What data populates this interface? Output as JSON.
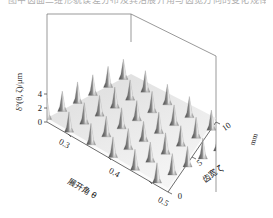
{
  "figure": {
    "kind": "surface-3d",
    "background": "#ffffff",
    "cut_off_caption": "图中齿面三维形貌误差分布及其沿展开角与齿宽方向的变化规律"
  },
  "chart_data": {
    "type": "heatmap",
    "title": "",
    "subtitle": "",
    "render_style": "3d-surface-mesh",
    "colormap": "grayscale",
    "colormap_low": "#4f4f4f",
    "colormap_high": "#f2f2f2",
    "grid": false,
    "legend": "none",
    "zlabel": "δ°(θ, ζ)/μm",
    "zticks": [
      "0",
      "2",
      "4"
    ],
    "ztick_values": [
      0,
      2,
      4
    ],
    "zlim": [
      0,
      5
    ],
    "xlabel": "展开角 θ",
    "xticks": [
      "0.3",
      "0.4",
      "0.5"
    ],
    "xtick_values": [
      0.3,
      0.4,
      0.5
    ],
    "xlim": [
      0.25,
      0.52
    ],
    "ylabel": "齿宽 ζ",
    "yunit": "mm",
    "yticks": [
      "0",
      "5",
      "10"
    ],
    "ytick_values": [
      0,
      5,
      10
    ],
    "ylim": [
      0,
      12
    ],
    "surface_description": "periodic array of sharp conical peaks, amplitude 0 to 5 um",
    "peak_amplitude_um": 5,
    "peak_count_x": 12,
    "peak_count_y": 12,
    "x": [
      0.25,
      0.2727,
      0.2955,
      0.3182,
      0.3409,
      0.3636,
      0.3864,
      0.4091,
      0.4318,
      0.4545,
      0.4773,
      0.5
    ],
    "y": [
      0,
      1.0909,
      2.1818,
      3.2727,
      4.3636,
      5.4545,
      6.5455,
      7.6364,
      8.7273,
      9.8182,
      10.9091,
      12
    ],
    "z_rows": [
      [
        4.8,
        0.4,
        4.6,
        0.5,
        4.9,
        0.3,
        4.7,
        0.4,
        4.8,
        0.5,
        4.6,
        0.4
      ],
      [
        0.5,
        0.2,
        0.6,
        0.2,
        0.5,
        0.2,
        0.6,
        0.2,
        0.5,
        0.2,
        0.6,
        0.2
      ],
      [
        4.6,
        0.5,
        4.9,
        0.4,
        4.7,
        0.5,
        4.8,
        0.3,
        4.6,
        0.4,
        4.9,
        0.5
      ],
      [
        0.4,
        0.2,
        0.5,
        0.2,
        0.6,
        0.2,
        0.4,
        0.2,
        0.5,
        0.2,
        0.6,
        0.2
      ],
      [
        4.9,
        0.4,
        4.7,
        0.5,
        4.8,
        0.4,
        4.6,
        0.5,
        4.9,
        0.3,
        4.7,
        0.4
      ],
      [
        0.5,
        0.2,
        0.6,
        0.2,
        0.4,
        0.2,
        0.5,
        0.2,
        0.6,
        0.2,
        0.4,
        0.2
      ],
      [
        4.7,
        0.5,
        4.8,
        0.3,
        4.6,
        0.4,
        4.9,
        0.5,
        4.7,
        0.4,
        4.8,
        0.5
      ],
      [
        0.6,
        0.2,
        0.4,
        0.2,
        0.5,
        0.2,
        0.6,
        0.2,
        0.4,
        0.2,
        0.5,
        0.2
      ],
      [
        4.8,
        0.4,
        4.6,
        0.5,
        4.9,
        0.3,
        4.7,
        0.4,
        4.8,
        0.5,
        4.6,
        0.4
      ],
      [
        0.4,
        0.2,
        0.6,
        0.2,
        0.5,
        0.2,
        0.4,
        0.2,
        0.6,
        0.2,
        0.5,
        0.2
      ],
      [
        4.6,
        0.5,
        4.9,
        0.4,
        4.7,
        0.5,
        4.8,
        0.3,
        4.6,
        0.4,
        4.9,
        0.5
      ],
      [
        0.5,
        0.2,
        0.4,
        0.2,
        0.6,
        0.2,
        0.5,
        0.2,
        0.4,
        0.2,
        0.6,
        0.2
      ]
    ]
  }
}
